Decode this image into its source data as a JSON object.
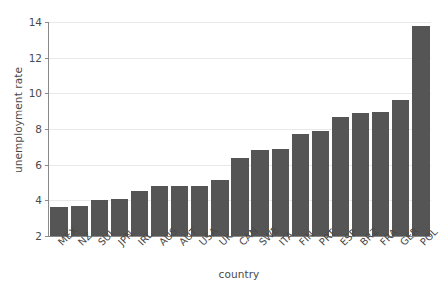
{
  "chart_data": {
    "type": "bar",
    "title": "",
    "xlabel": "country",
    "ylabel": "unemployment rate",
    "grid": true,
    "legend": false,
    "ylim": [
      2,
      14
    ],
    "yticks": [
      2,
      4,
      6,
      8,
      10,
      12,
      14
    ],
    "bar_color": "#555555",
    "grid_color": "#e9e9e9",
    "axis_color": "#8a8a8a",
    "text_color": "#4a4a4a",
    "background": "#ffffff",
    "xtick_rotation": -45,
    "categories": [
      "MEX",
      "NZ",
      "SUI",
      "JPN",
      "IRL",
      "AUS",
      "AUT",
      "USA",
      "UK",
      "CAN",
      "SWE",
      "ITA",
      "FIN",
      "PRT",
      "ESP",
      "BRZ",
      "FRA",
      "GER",
      "POL"
    ],
    "values": [
      3.6,
      3.7,
      4.0,
      4.1,
      4.55,
      4.8,
      4.8,
      4.8,
      5.15,
      6.35,
      6.85,
      6.9,
      7.7,
      7.9,
      8.65,
      8.9,
      8.95,
      9.65,
      13.8
    ]
  }
}
